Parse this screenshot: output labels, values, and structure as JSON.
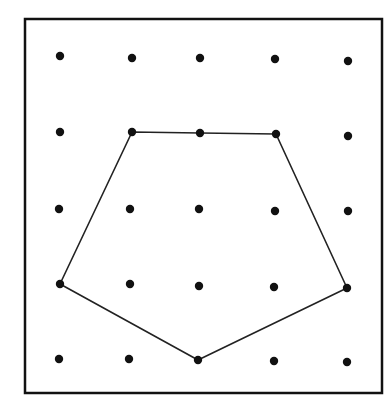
{
  "diagram": {
    "type": "geoboard",
    "grid": {
      "rows": 5,
      "cols": 5
    },
    "frame": {
      "x1": 25,
      "y1": 19,
      "x2": 382,
      "y2": 393,
      "color": "#111111",
      "stroke_width": 2.5
    },
    "dot_color": "#111111",
    "dot_radius": 4.2,
    "line_color": "#222222",
    "dots": [
      [
        [
          60,
          56
        ],
        [
          132,
          58
        ],
        [
          200,
          58
        ],
        [
          275,
          59
        ],
        [
          348,
          61
        ]
      ],
      [
        [
          60,
          132
        ],
        [
          132,
          132
        ],
        [
          200,
          133
        ],
        [
          276,
          134
        ],
        [
          348,
          136
        ]
      ],
      [
        [
          59,
          209
        ],
        [
          130,
          209
        ],
        [
          199,
          209
        ],
        [
          275,
          211
        ],
        [
          348,
          211
        ]
      ],
      [
        [
          60,
          284
        ],
        [
          130,
          284
        ],
        [
          199,
          286
        ],
        [
          274,
          287
        ],
        [
          347,
          288
        ]
      ],
      [
        [
          59,
          359
        ],
        [
          129,
          359
        ],
        [
          198,
          360
        ],
        [
          274,
          361
        ],
        [
          347,
          362
        ]
      ]
    ],
    "polygon": {
      "name": "pentagon",
      "vertices_grid": [
        [
          1,
          1
        ],
        [
          1,
          2
        ],
        [
          1,
          3
        ],
        [
          3,
          4
        ],
        [
          4,
          2
        ],
        [
          3,
          0
        ]
      ],
      "vertices_px": [
        [
          132,
          132
        ],
        [
          200,
          133
        ],
        [
          276,
          134
        ],
        [
          347,
          288
        ],
        [
          198,
          360
        ],
        [
          60,
          284
        ]
      ]
    }
  }
}
